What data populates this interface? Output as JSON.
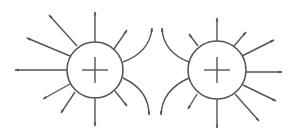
{
  "diagram": {
    "title": "Electric field lines of two equal positive charges",
    "stroke_color": "#555555",
    "background": "#ffffff",
    "charges": [
      {
        "id": "left",
        "sign": "+",
        "cx": 95,
        "cy": 70,
        "r": 28
      },
      {
        "id": "right",
        "sign": "+",
        "cx": 217,
        "cy": 70,
        "r": 29
      }
    ],
    "field_lines_left": [
      {
        "x1": 67,
        "y1": 70,
        "x2": 15,
        "y2": 70
      },
      {
        "x1": 70,
        "y1": 56,
        "x2": 27,
        "y2": 38
      },
      {
        "x1": 77,
        "y1": 46,
        "x2": 49,
        "y2": 15
      },
      {
        "x1": 95,
        "y1": 42,
        "x2": 95,
        "y2": 12
      },
      {
        "x1": 114,
        "y1": 49,
        "x2": 127,
        "y2": 30
      },
      {
        "x1": 70,
        "y1": 84,
        "x2": 43,
        "y2": 99
      },
      {
        "x1": 75,
        "y1": 92,
        "x2": 61,
        "y2": 113
      },
      {
        "x1": 95,
        "y1": 98,
        "x2": 95,
        "y2": 126
      },
      {
        "x1": 115,
        "y1": 91,
        "x2": 127,
        "y2": 106
      }
    ],
    "field_lines_right": [
      {
        "x1": 246,
        "y1": 72,
        "x2": 282,
        "y2": 72
      },
      {
        "x1": 242,
        "y1": 56,
        "x2": 274,
        "y2": 40
      },
      {
        "x1": 234,
        "y1": 46,
        "x2": 246,
        "y2": 32
      },
      {
        "x1": 217,
        "y1": 41,
        "x2": 217,
        "y2": 18
      },
      {
        "x1": 198,
        "y1": 46,
        "x2": 189,
        "y2": 34
      },
      {
        "x1": 243,
        "y1": 85,
        "x2": 276,
        "y2": 101
      },
      {
        "x1": 235,
        "y1": 94,
        "x2": 259,
        "y2": 121
      },
      {
        "x1": 217,
        "y1": 99,
        "x2": 217,
        "y2": 128
      },
      {
        "x1": 197,
        "y1": 94,
        "x2": 188,
        "y2": 109
      }
    ],
    "curved_lines": [
      {
        "d": "M 123 62 Q 150 52 152 28",
        "tip": [
          152,
          27
        ],
        "dir": "up"
      },
      {
        "d": "M 189 62 Q 163 52 162 28",
        "tip": [
          162,
          27
        ],
        "dir": "up"
      },
      {
        "d": "M 123 78 Q 149 90 149 115",
        "tip": [
          149,
          116
        ],
        "dir": "down"
      },
      {
        "d": "M 189 78 Q 162 90 161 115",
        "tip": [
          161,
          116
        ],
        "dir": "down"
      }
    ]
  }
}
